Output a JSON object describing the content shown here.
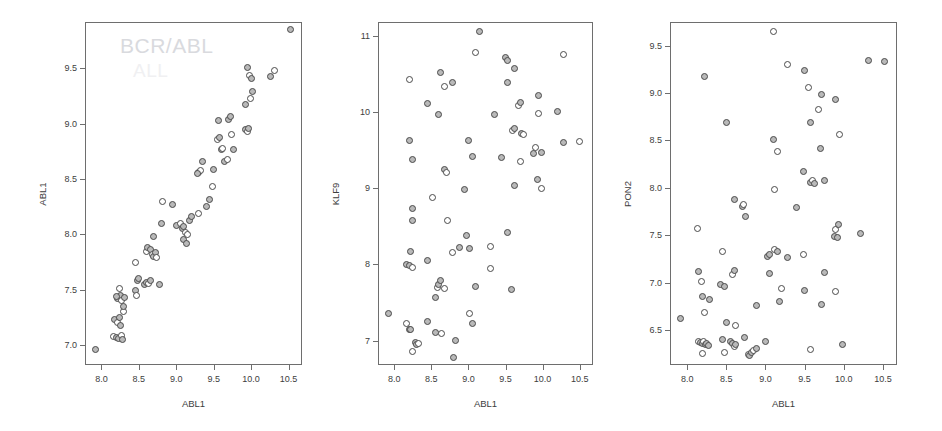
{
  "figure": {
    "background": "#ffffff",
    "marker_fill": "#b9b9b9",
    "marker_stroke": "#4a4a4a",
    "frame_color": "#6e6e6e",
    "watermark_color": "#d9dade"
  },
  "watermark": {
    "line1": "BCR/ABL",
    "line2": "ALL"
  },
  "chart_data": [
    {
      "type": "scatter",
      "title": "",
      "xlabel": "ABL1",
      "ylabel": "ABL1",
      "xlim": [
        7.78,
        10.68
      ],
      "ylim": [
        6.82,
        9.92
      ],
      "xticks": [
        "8.0",
        "8.5",
        "9.0",
        "9.5",
        "10.0",
        "10.5"
      ],
      "xtickvals": [
        8.0,
        8.5,
        9.0,
        9.5,
        10.0,
        10.5
      ],
      "yticks": [
        "7.0",
        "7.5",
        "8.0",
        "8.5",
        "9.0",
        "9.5"
      ],
      "ytickvals": [
        7.0,
        7.5,
        8.0,
        8.5,
        9.0,
        9.5
      ],
      "grid": false,
      "legend": "none",
      "annotation": "BCR/ABL",
      "points": [
        [
          7.92,
          6.96
        ],
        [
          8.16,
          7.08
        ],
        [
          8.2,
          7.07
        ],
        [
          8.23,
          7.06
        ],
        [
          8.27,
          7.09
        ],
        [
          8.28,
          7.05
        ],
        [
          8.18,
          7.23
        ],
        [
          8.21,
          7.2
        ],
        [
          8.24,
          7.25
        ],
        [
          8.26,
          7.18
        ],
        [
          8.29,
          7.3
        ],
        [
          8.22,
          7.42
        ],
        [
          8.25,
          7.45
        ],
        [
          8.27,
          7.4
        ],
        [
          8.2,
          7.44
        ],
        [
          8.29,
          7.35
        ],
        [
          8.24,
          7.51
        ],
        [
          8.31,
          7.43
        ],
        [
          8.45,
          7.49
        ],
        [
          8.47,
          7.45
        ],
        [
          8.48,
          7.58
        ],
        [
          8.5,
          7.6
        ],
        [
          8.46,
          7.75
        ],
        [
          8.58,
          7.55
        ],
        [
          8.6,
          7.57
        ],
        [
          8.63,
          7.56
        ],
        [
          8.65,
          7.58
        ],
        [
          8.78,
          7.55
        ],
        [
          8.6,
          7.85
        ],
        [
          8.62,
          7.88
        ],
        [
          8.66,
          7.86
        ],
        [
          8.68,
          7.82
        ],
        [
          8.7,
          7.8
        ],
        [
          8.72,
          7.84
        ],
        [
          8.74,
          7.79
        ],
        [
          8.7,
          7.98
        ],
        [
          8.8,
          8.1
        ],
        [
          8.82,
          8.3
        ],
        [
          8.95,
          8.27
        ],
        [
          9.0,
          8.08
        ],
        [
          9.05,
          8.1
        ],
        [
          9.08,
          8.05
        ],
        [
          9.1,
          8.07
        ],
        [
          9.12,
          8.02
        ],
        [
          9.1,
          7.95
        ],
        [
          9.13,
          7.92
        ],
        [
          9.15,
          8.0
        ],
        [
          9.18,
          8.13
        ],
        [
          9.2,
          8.16
        ],
        [
          9.3,
          8.19
        ],
        [
          9.4,
          8.25
        ],
        [
          9.45,
          8.32
        ],
        [
          9.48,
          8.43
        ],
        [
          9.5,
          8.59
        ],
        [
          9.3,
          8.56
        ],
        [
          9.33,
          8.58
        ],
        [
          9.35,
          8.66
        ],
        [
          9.28,
          8.55
        ],
        [
          9.55,
          8.86
        ],
        [
          9.58,
          8.88
        ],
        [
          9.6,
          8.77
        ],
        [
          9.62,
          8.78
        ],
        [
          9.56,
          9.03
        ],
        [
          9.65,
          8.66
        ],
        [
          9.68,
          8.68
        ],
        [
          9.7,
          9.04
        ],
        [
          9.72,
          9.07
        ],
        [
          9.74,
          8.9
        ],
        [
          9.76,
          8.77
        ],
        [
          9.92,
          8.95
        ],
        [
          9.95,
          8.93
        ],
        [
          9.97,
          8.96
        ],
        [
          9.93,
          9.17
        ],
        [
          9.99,
          9.23
        ],
        [
          10.02,
          9.29
        ],
        [
          9.95,
          9.51
        ],
        [
          9.98,
          9.44
        ],
        [
          10.01,
          9.41
        ],
        [
          10.26,
          9.43
        ],
        [
          10.31,
          9.48
        ],
        [
          10.52,
          9.85
        ]
      ]
    },
    {
      "type": "scatter",
      "title": "",
      "xlabel": "ABL1",
      "ylabel": "KLF9",
      "xlim": [
        7.78,
        10.68
      ],
      "ylim": [
        6.68,
        11.18
      ],
      "xticks": [
        "8.0",
        "8.5",
        "9.0",
        "9.5",
        "10.0",
        "10.5"
      ],
      "xtickvals": [
        8.0,
        8.5,
        9.0,
        9.5,
        10.0,
        10.5
      ],
      "yticks": [
        "7",
        "8",
        "9",
        "10",
        "11"
      ],
      "ytickvals": [
        7,
        8,
        9,
        10,
        11
      ],
      "grid": false,
      "legend": "none",
      "points": [
        [
          7.92,
          7.35
        ],
        [
          8.16,
          7.22
        ],
        [
          8.2,
          7.14
        ],
        [
          8.22,
          7.15
        ],
        [
          8.25,
          6.86
        ],
        [
          8.28,
          6.98
        ],
        [
          8.3,
          6.95
        ],
        [
          8.32,
          6.96
        ],
        [
          8.45,
          7.25
        ],
        [
          8.56,
          7.11
        ],
        [
          8.63,
          7.09
        ],
        [
          8.8,
          6.78
        ],
        [
          8.82,
          7.0
        ],
        [
          9.02,
          7.36
        ],
        [
          9.05,
          7.23
        ],
        [
          8.55,
          7.57
        ],
        [
          8.58,
          7.7
        ],
        [
          8.6,
          7.74
        ],
        [
          8.62,
          7.79
        ],
        [
          8.68,
          7.68
        ],
        [
          9.1,
          7.71
        ],
        [
          9.58,
          7.67
        ],
        [
          9.3,
          7.95
        ],
        [
          8.17,
          8.0
        ],
        [
          8.2,
          7.98
        ],
        [
          8.24,
          7.96
        ],
        [
          8.22,
          8.17
        ],
        [
          8.45,
          8.05
        ],
        [
          8.78,
          8.15
        ],
        [
          8.88,
          8.22
        ],
        [
          9.02,
          8.21
        ],
        [
          9.3,
          8.24
        ],
        [
          8.98,
          8.38
        ],
        [
          9.52,
          8.42
        ],
        [
          8.72,
          8.58
        ],
        [
          8.25,
          8.57
        ],
        [
          8.24,
          8.73
        ],
        [
          8.52,
          8.88
        ],
        [
          8.95,
          8.98
        ],
        [
          9.62,
          9.04
        ],
        [
          9.98,
          9.0
        ],
        [
          9.93,
          9.12
        ],
        [
          8.68,
          9.25
        ],
        [
          8.7,
          9.2
        ],
        [
          9.05,
          9.42
        ],
        [
          9.45,
          9.4
        ],
        [
          9.7,
          9.35
        ],
        [
          9.88,
          9.45
        ],
        [
          9.98,
          9.47
        ],
        [
          9.9,
          9.53
        ],
        [
          8.2,
          9.62
        ],
        [
          9.0,
          9.63
        ],
        [
          10.5,
          9.61
        ],
        [
          10.28,
          9.6
        ],
        [
          8.25,
          9.38
        ],
        [
          9.6,
          9.75
        ],
        [
          9.62,
          9.78
        ],
        [
          9.72,
          9.72
        ],
        [
          9.74,
          9.71
        ],
        [
          8.6,
          9.96
        ],
        [
          9.35,
          9.96
        ],
        [
          9.95,
          9.98
        ],
        [
          10.2,
          10.01
        ],
        [
          8.45,
          10.11
        ],
        [
          9.68,
          10.09
        ],
        [
          9.7,
          10.12
        ],
        [
          9.95,
          10.21
        ],
        [
          8.68,
          10.33
        ],
        [
          8.78,
          10.38
        ],
        [
          9.52,
          10.39
        ],
        [
          8.2,
          10.42
        ],
        [
          8.62,
          10.52
        ],
        [
          9.62,
          10.57
        ],
        [
          9.1,
          10.78
        ],
        [
          9.5,
          10.72
        ],
        [
          9.52,
          10.68
        ],
        [
          10.28,
          10.75
        ],
        [
          9.15,
          11.05
        ]
      ]
    },
    {
      "type": "scatter",
      "title": "",
      "xlabel": "ABL1",
      "ylabel": "PON2",
      "xlim": [
        7.78,
        10.68
      ],
      "ylim": [
        6.13,
        9.75
      ],
      "xticks": [
        "8.0",
        "8.5",
        "9.0",
        "9.5",
        "10.0",
        "10.5"
      ],
      "xtickvals": [
        8.0,
        8.5,
        9.0,
        9.5,
        10.0,
        10.5
      ],
      "yticks": [
        "6.5",
        "7.0",
        "7.5",
        "8.0",
        "8.5",
        "9.0",
        "9.5"
      ],
      "ytickvals": [
        6.5,
        7.0,
        7.5,
        8.0,
        8.5,
        9.0,
        9.5
      ],
      "grid": false,
      "legend": "none",
      "points": [
        [
          7.92,
          6.62
        ],
        [
          8.15,
          6.38
        ],
        [
          8.17,
          6.37
        ],
        [
          8.19,
          6.36
        ],
        [
          8.21,
          6.38
        ],
        [
          8.23,
          6.35
        ],
        [
          8.25,
          6.36
        ],
        [
          8.2,
          6.25
        ],
        [
          8.27,
          6.34
        ],
        [
          8.45,
          6.4
        ],
        [
          8.47,
          6.26
        ],
        [
          8.55,
          6.38
        ],
        [
          8.58,
          6.36
        ],
        [
          8.6,
          6.33
        ],
        [
          8.62,
          6.35
        ],
        [
          8.73,
          6.42
        ],
        [
          8.78,
          6.24
        ],
        [
          8.8,
          6.23
        ],
        [
          8.82,
          6.26
        ],
        [
          8.85,
          6.28
        ],
        [
          8.88,
          6.3
        ],
        [
          9.0,
          6.38
        ],
        [
          9.58,
          6.29
        ],
        [
          9.98,
          6.35
        ],
        [
          8.5,
          6.58
        ],
        [
          8.62,
          6.55
        ],
        [
          8.88,
          6.76
        ],
        [
          9.18,
          6.8
        ],
        [
          8.22,
          6.68
        ],
        [
          8.2,
          6.85
        ],
        [
          8.28,
          6.82
        ],
        [
          9.2,
          6.94
        ],
        [
          9.5,
          6.92
        ],
        [
          9.72,
          6.77
        ],
        [
          9.9,
          6.91
        ],
        [
          8.42,
          6.98
        ],
        [
          8.48,
          6.96
        ],
        [
          8.18,
          7.01
        ],
        [
          8.15,
          7.12
        ],
        [
          9.05,
          7.1
        ],
        [
          8.58,
          7.08
        ],
        [
          8.6,
          7.13
        ],
        [
          9.75,
          7.11
        ],
        [
          8.45,
          7.33
        ],
        [
          9.02,
          7.28
        ],
        [
          9.05,
          7.3
        ],
        [
          9.12,
          7.35
        ],
        [
          9.15,
          7.33
        ],
        [
          9.28,
          7.26
        ],
        [
          9.48,
          7.3
        ],
        [
          9.88,
          7.49
        ],
        [
          9.92,
          7.48
        ],
        [
          9.9,
          7.56
        ],
        [
          9.93,
          7.61
        ],
        [
          10.22,
          7.52
        ],
        [
          8.13,
          7.57
        ],
        [
          8.6,
          7.88
        ],
        [
          8.7,
          7.8
        ],
        [
          8.72,
          7.82
        ],
        [
          8.75,
          7.7
        ],
        [
          9.4,
          7.79
        ],
        [
          9.12,
          7.98
        ],
        [
          9.48,
          8.17
        ],
        [
          9.58,
          8.06
        ],
        [
          9.6,
          8.08
        ],
        [
          9.62,
          8.05
        ],
        [
          9.75,
          8.08
        ],
        [
          9.15,
          8.38
        ],
        [
          9.1,
          8.51
        ],
        [
          9.7,
          8.42
        ],
        [
          9.95,
          8.56
        ],
        [
          8.5,
          8.69
        ],
        [
          9.58,
          8.69
        ],
        [
          9.68,
          8.83
        ],
        [
          9.72,
          8.98
        ],
        [
          9.9,
          8.93
        ],
        [
          9.55,
          9.06
        ],
        [
          8.22,
          9.18
        ],
        [
          9.5,
          9.24
        ],
        [
          9.28,
          9.3
        ],
        [
          10.32,
          9.34
        ],
        [
          10.52,
          9.33
        ],
        [
          9.1,
          9.65
        ]
      ]
    }
  ]
}
